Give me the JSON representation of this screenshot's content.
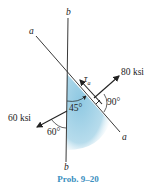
{
  "diagram": {
    "lines": {
      "a_label": "a",
      "b_label": "b"
    },
    "stress_labels": {
      "tau": "τ",
      "tau_sub": "a",
      "normal_right": "80 ksi",
      "normal_left": "60 ksi"
    },
    "angles": {
      "wedge": "45°",
      "right": "90°",
      "left": "60°"
    },
    "colors": {
      "fill": "#a9d4e8",
      "stroke": "#222222",
      "caption": "#3a8fc0"
    }
  },
  "caption": "Prob. 9–20"
}
